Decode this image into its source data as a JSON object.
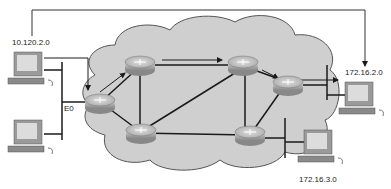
{
  "diagram": {
    "type": "network-topology",
    "colors": {
      "cloud_fill": "#cfcfcf",
      "cloud_stroke": "#555555",
      "link": "#1a1a1a",
      "router_top": "#b8b8b8",
      "router_side": "#8a8a8a",
      "pc_body": "#9a9a9a",
      "pc_screen": "#dcdcdc",
      "arrow": "#1a1a1a"
    },
    "networks": [
      {
        "id": "net-a",
        "label": "10.120.2.0"
      },
      {
        "id": "net-b",
        "label": "172.16.2.0"
      },
      {
        "id": "net-c",
        "label": "172.16.3.0"
      }
    ],
    "interface_label": "E0",
    "routers": [
      {
        "id": "r1",
        "name": "edge-router-left"
      },
      {
        "id": "r2",
        "name": "router-top-left"
      },
      {
        "id": "r3",
        "name": "router-top-right"
      },
      {
        "id": "r4",
        "name": "edge-router-right"
      },
      {
        "id": "r5",
        "name": "router-bottom-left"
      },
      {
        "id": "r6",
        "name": "router-bottom-right"
      }
    ],
    "hosts": [
      {
        "id": "pc1",
        "network": "10.120.2.0"
      },
      {
        "id": "pc2",
        "network": "10.120.2.0"
      },
      {
        "id": "pc3",
        "network": "172.16.2.0"
      },
      {
        "id": "pc4",
        "network": "172.16.3.0"
      }
    ],
    "links": [
      [
        "r1",
        "r2"
      ],
      [
        "r2",
        "r3"
      ],
      [
        "r3",
        "r4"
      ],
      [
        "r1",
        "r5"
      ],
      [
        "r5",
        "r6"
      ],
      [
        "r6",
        "r4"
      ],
      [
        "r2",
        "r5"
      ],
      [
        "r3",
        "r6"
      ],
      [
        "r5",
        "r3"
      ]
    ],
    "path_arrows": [
      "pc1->r1",
      "r1->r2",
      "r2->r3",
      "r3->r4",
      "r4->pc3"
    ]
  }
}
